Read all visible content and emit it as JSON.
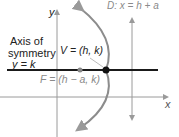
{
  "diagram": {
    "type": "parabola-horizontal-axis",
    "labels": {
      "y_axis": "y",
      "x_axis": "x",
      "directrix": "D: x = h + a",
      "axis_of_symmetry_line1": "Axis of",
      "axis_of_symmetry_line2": "symmetry",
      "axis_of_symmetry_line3": "y = k",
      "vertex": "V = (h, k)",
      "focus": "F = (h − a, k)"
    },
    "colors": {
      "axes": "#9a9a9a",
      "axis_of_symmetry": "#1a1a1a",
      "parabola": "#8c8c8c",
      "directrix": "#9a9a9a",
      "text_dark": "#222222",
      "text_light": "#8a8a8a",
      "vertex_dot": "#111111",
      "focus_dot": "#888888"
    }
  }
}
